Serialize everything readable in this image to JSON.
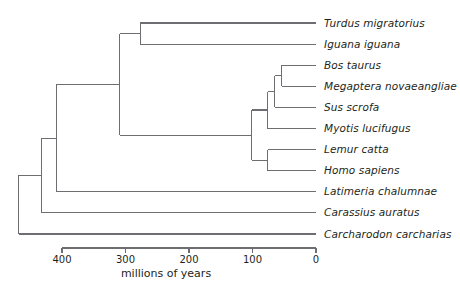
{
  "chart_data": {
    "type": "tree",
    "title": "",
    "xlabel": "millions of years",
    "ylabel": "",
    "xlim": [
      470,
      0
    ],
    "axis_ticks": [
      {
        "value": 400,
        "label": "400"
      },
      {
        "value": 300,
        "label": "300"
      },
      {
        "value": 200,
        "label": "200"
      },
      {
        "value": 100,
        "label": "100"
      },
      {
        "value": 0,
        "label": "0"
      }
    ],
    "grid": false,
    "legend": null,
    "orientation": "left-to-right, time decreasing to the right",
    "taxa": [
      {
        "index": 0,
        "name": "Turdus migratorius",
        "tip_age": 0
      },
      {
        "index": 1,
        "name": "Iguana iguana",
        "tip_age": 0
      },
      {
        "index": 2,
        "name": "Bos taurus",
        "tip_age": 0
      },
      {
        "index": 3,
        "name": "Megaptera novaeangliae",
        "tip_age": 0
      },
      {
        "index": 4,
        "name": "Sus scrofa",
        "tip_age": 0
      },
      {
        "index": 5,
        "name": "Myotis lucifugus",
        "tip_age": 0
      },
      {
        "index": 6,
        "name": "Lemur catta",
        "tip_age": 0
      },
      {
        "index": 7,
        "name": "Homo sapiens",
        "tip_age": 0
      },
      {
        "index": 8,
        "name": "Latimeria chalumnae",
        "tip_age": 0
      },
      {
        "index": 9,
        "name": "Carassius auratus",
        "tip_age": 0
      },
      {
        "index": 10,
        "name": "Carcharodon carcharias",
        "tip_age": 0
      }
    ],
    "nodes": [
      {
        "id": "root",
        "age": 468,
        "children": [
          "gnathostome",
          "taxon-10"
        ]
      },
      {
        "id": "gnathostome",
        "age": 432,
        "children": [
          "bony-fish",
          "taxon-9"
        ]
      },
      {
        "id": "bony-fish",
        "age": 408,
        "children": [
          "tetrapod",
          "taxon-8"
        ]
      },
      {
        "id": "tetrapod",
        "age": 309,
        "children": [
          "reptile",
          "mammal"
        ]
      },
      {
        "id": "reptile",
        "age": 277,
        "children": [
          "taxon-0",
          "taxon-1"
        ]
      },
      {
        "id": "mammal",
        "age": 101,
        "children": [
          "laurasiatheria",
          "primate"
        ]
      },
      {
        "id": "laurasiatheria",
        "age": 76,
        "children": [
          "taxon-5",
          "artiodactyl"
        ]
      },
      {
        "id": "artiodactyl",
        "age": 65,
        "children": [
          "taxon-4",
          "cetartio"
        ]
      },
      {
        "id": "cetartio",
        "age": 54,
        "children": [
          "taxon-2",
          "taxon-3"
        ]
      },
      {
        "id": "primate",
        "age": 76,
        "children": [
          "taxon-6",
          "taxon-7"
        ]
      }
    ]
  },
  "colors": {
    "line": "#6d6e71",
    "text": "#231f20",
    "background": "#ffffff"
  }
}
